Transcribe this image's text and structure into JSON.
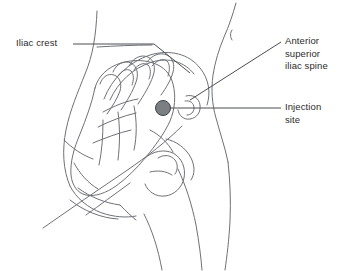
{
  "figure": {
    "background_color": "#ffffff",
    "line_color": "#6e7176",
    "text_color": "#2b2b2b"
  },
  "labels": {
    "iliac_crest": "Iliac crest",
    "anterior_superior_iliac_spine": "Anterior\nsuperior\niliac spine",
    "injection_site": "Injection\nsite"
  },
  "markers": {
    "injection_site_dot": {
      "name": "injection-site-dot",
      "cx": 163,
      "cy": 108,
      "r": 7.5,
      "fill": "#7b7e83",
      "stroke": "#3f4246"
    }
  },
  "leader_lines": {
    "iliac_crest": {
      "name": "iliac-crest-leader",
      "points": "73,44 154,44 190,73"
    },
    "anterior_superior_iliac_spine": {
      "name": "asis-leader",
      "points": "281,42 190,100"
    },
    "injection_site": {
      "name": "injection-site-leader",
      "points": "281,108 168,108"
    }
  }
}
